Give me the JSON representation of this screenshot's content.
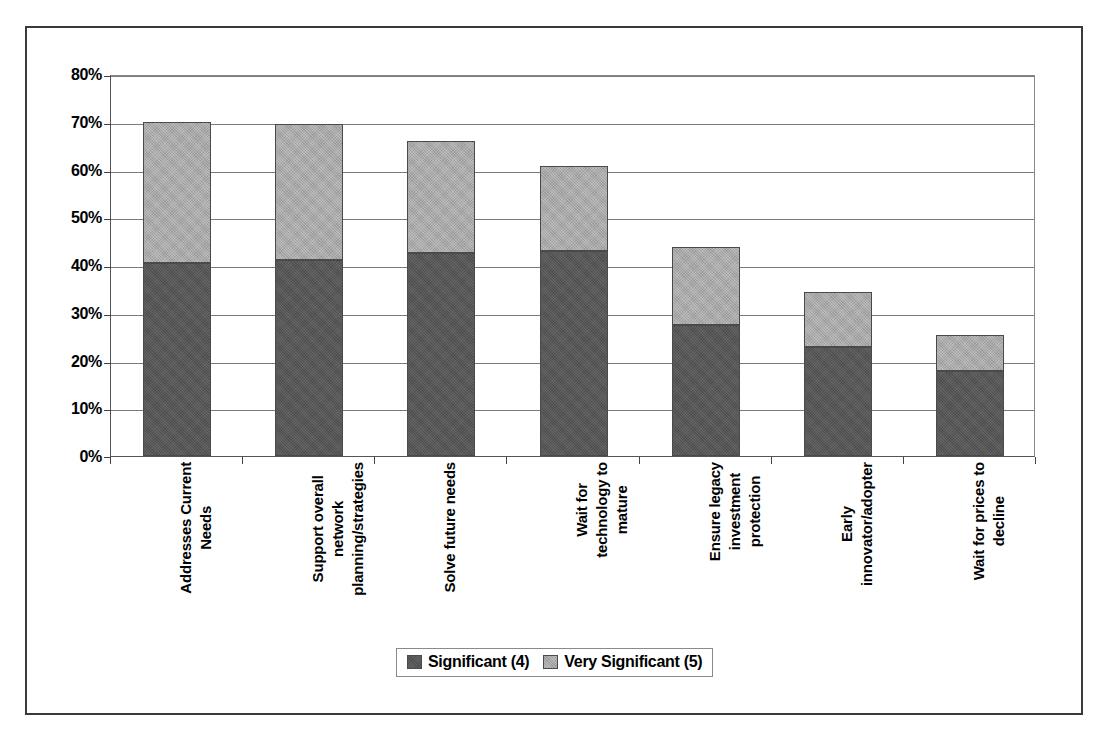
{
  "chart_data": {
    "type": "bar",
    "subtype": "stacked-column",
    "title": "",
    "subtitle": "",
    "xlabel": "",
    "ylabel": "",
    "ylim": [
      0,
      80
    ],
    "yunit": "%",
    "grid": true,
    "legend_position": "bottom",
    "ytick_labels": [
      "80%",
      "70%",
      "60%",
      "50%",
      "40%",
      "30%",
      "20%",
      "10%",
      "0%"
    ],
    "ytick_values": [
      80,
      70,
      60,
      50,
      40,
      30,
      20,
      10,
      0
    ],
    "categories": [
      "Addresses Current\nNeeds",
      "Support overall\nnetwork\nplanning/strategies",
      "Solve future needs",
      "Wait for\ntechnology to\nmature",
      "Ensure legacy\ninvestment\nprotection",
      "Early\ninnovator/adopter",
      "Wait for prices to\ndecline"
    ],
    "series": [
      {
        "name": "Significant (4)",
        "color": "#565656",
        "values": [
          40.5,
          41.0,
          42.5,
          43.0,
          27.5,
          22.8,
          17.8
        ]
      },
      {
        "name": "Very Significant (5)",
        "color": "#a9a9a9",
        "values": [
          29.5,
          28.6,
          23.4,
          17.7,
          16.2,
          11.5,
          7.5
        ]
      }
    ],
    "totals": [
      70.0,
      69.6,
      65.9,
      60.7,
      43.7,
      34.3,
      25.3
    ]
  },
  "legend": {
    "entries": [
      {
        "label": "Significant (4)",
        "color": "#565656"
      },
      {
        "label": "Very Significant (5)",
        "color": "#a9a9a9"
      }
    ]
  }
}
